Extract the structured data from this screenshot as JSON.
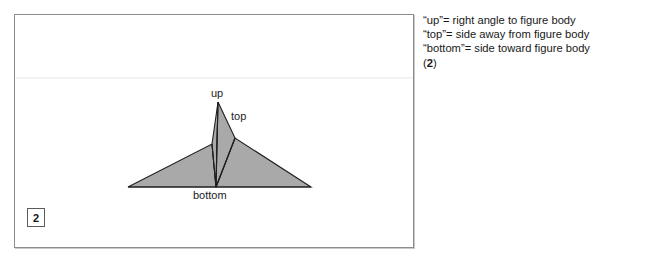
{
  "figure": {
    "panel_name": "figure-panel",
    "page_badge": "2",
    "labels": {
      "up": "up",
      "top": "top",
      "bottom": "bottom"
    },
    "colors": {
      "shape_fill": "#a9a9a9",
      "shape_stroke": "#1f1f1f",
      "panel_border": "#8c8c8c",
      "background": "#ffffff",
      "text": "#181818"
    },
    "diagram": {
      "type": "line-drawing",
      "description": "shaded dart/arrow-like polygon with a vertical central spike labelled up, a right-hand facet labelled top, and a horizontal base labelled bottom",
      "vertices": {
        "apex_up": "217,101",
        "left_wing_tip": "127,186",
        "right_wing_tip": "310,186",
        "base_center_bottom": "215,186",
        "left_shoulder": "211,143",
        "right_shoulder": "234,137"
      }
    }
  },
  "caption": {
    "lines": [
      "“up”= right angle to figure body",
      "“top”= side away from figure body",
      "“bottom”= side toward figure body"
    ],
    "number_prefix": "(",
    "number": "2",
    "number_suffix": ")"
  }
}
